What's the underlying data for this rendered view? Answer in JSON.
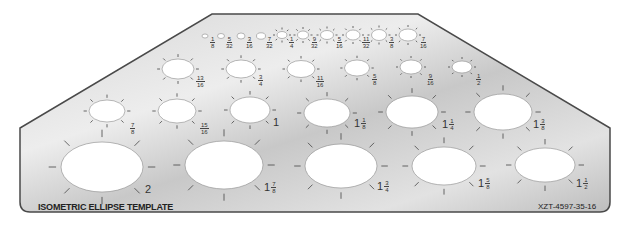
{
  "template": {
    "title": "ISOMETRIC ELLIPSE TEMPLATE",
    "part_number": "XZT-4597-35-16",
    "colors": {
      "plate": "#cfcfcf",
      "plate_highlight": "#ececec",
      "outline": "#555555",
      "hole": "#ffffff",
      "tick": "#444444"
    }
  },
  "ellipses": [
    {
      "size": "1/8",
      "whole": "",
      "num": "1",
      "den": "8",
      "cx": 205,
      "cy": 36,
      "rx": 3,
      "ry": 2,
      "lx": 210,
      "ly": 34,
      "ticks": false
    },
    {
      "size": "5/32",
      "whole": "",
      "num": "5",
      "den": "32",
      "cx": 221,
      "cy": 36,
      "rx": 3.5,
      "ry": 2.5,
      "lx": 226,
      "ly": 34,
      "ticks": false
    },
    {
      "size": "3/16",
      "whole": "",
      "num": "3",
      "den": "16",
      "cx": 241,
      "cy": 36,
      "rx": 4,
      "ry": 3,
      "lx": 246,
      "ly": 34,
      "ticks": false
    },
    {
      "size": "7/32",
      "whole": "",
      "num": "7",
      "den": "32",
      "cx": 261,
      "cy": 36,
      "rx": 4.5,
      "ry": 3.2,
      "lx": 266,
      "ly": 34,
      "ticks": false
    },
    {
      "size": "1/4",
      "whole": "",
      "num": "1",
      "den": "4",
      "cx": 282,
      "cy": 35,
      "rx": 5,
      "ry": 3.5,
      "lx": 289,
      "ly": 34,
      "ticks": true
    },
    {
      "size": "9/32",
      "whole": "",
      "num": "9",
      "den": "32",
      "cx": 303,
      "cy": 35,
      "rx": 5.5,
      "ry": 4,
      "lx": 311,
      "ly": 34,
      "ticks": true
    },
    {
      "size": "5/16",
      "whole": "",
      "num": "5",
      "den": "16",
      "cx": 327,
      "cy": 35,
      "rx": 6.5,
      "ry": 4.5,
      "lx": 336,
      "ly": 34,
      "ticks": true
    },
    {
      "size": "11/32",
      "whole": "",
      "num": "11",
      "den": "32",
      "cx": 353,
      "cy": 35,
      "rx": 7,
      "ry": 5,
      "lx": 362,
      "ly": 34,
      "ticks": true
    },
    {
      "size": "3/8",
      "whole": "",
      "num": "3",
      "den": "8",
      "cx": 379,
      "cy": 35,
      "rx": 7.5,
      "ry": 5.5,
      "lx": 389,
      "ly": 34,
      "ticks": true
    },
    {
      "size": "7/16",
      "whole": "",
      "num": "7",
      "den": "16",
      "cx": 408,
      "cy": 35,
      "rx": 9,
      "ry": 6,
      "lx": 420,
      "ly": 34,
      "ticks": true
    },
    {
      "size": "13/16",
      "whole": "",
      "num": "13",
      "den": "16",
      "cx": 178,
      "cy": 69,
      "rx": 16,
      "ry": 10,
      "lx": 196,
      "ly": 73,
      "ticks": true
    },
    {
      "size": "3/4",
      "whole": "",
      "num": "3",
      "den": "4",
      "cx": 241,
      "cy": 69,
      "rx": 15,
      "ry": 9,
      "lx": 258,
      "ly": 72,
      "ticks": true
    },
    {
      "size": "11/16",
      "whole": "",
      "num": "11",
      "den": "16",
      "cx": 301,
      "cy": 69,
      "rx": 14,
      "ry": 8.5,
      "lx": 316,
      "ly": 73,
      "ticks": true
    },
    {
      "size": "5/8",
      "whole": "",
      "num": "5",
      "den": "8",
      "cx": 357,
      "cy": 68,
      "rx": 12.5,
      "ry": 8,
      "lx": 372,
      "ly": 71,
      "ticks": true
    },
    {
      "size": "9/16",
      "whole": "",
      "num": "9",
      "den": "16",
      "cx": 411,
      "cy": 67,
      "rx": 11,
      "ry": 7,
      "lx": 427,
      "ly": 71,
      "ticks": true
    },
    {
      "size": "1/2",
      "whole": "",
      "num": "1",
      "den": "2",
      "cx": 462,
      "cy": 67,
      "rx": 10,
      "ry": 6,
      "lx": 476,
      "ly": 71,
      "ticks": true
    },
    {
      "size": "7/8",
      "whole": "",
      "num": "7",
      "den": "8",
      "cx": 107,
      "cy": 111,
      "rx": 18,
      "ry": 11,
      "lx": 130,
      "ly": 120,
      "ticks": true
    },
    {
      "size": "15/16",
      "whole": "",
      "num": "15",
      "den": "16",
      "cx": 177,
      "cy": 111,
      "rx": 19,
      "ry": 12,
      "lx": 200,
      "ly": 120,
      "ticks": true
    },
    {
      "size": "1",
      "whole": "1",
      "num": "",
      "den": "",
      "cx": 250,
      "cy": 110,
      "rx": 20,
      "ry": 13,
      "lx": 273,
      "ly": 119,
      "ticks": true
    },
    {
      "size": "1 1/8",
      "whole": "1",
      "num": "1",
      "den": "8",
      "cx": 327,
      "cy": 113,
      "rx": 23,
      "ry": 14,
      "lx": 354,
      "ly": 120,
      "ticks": true
    },
    {
      "size": "1 1/4",
      "whole": "1",
      "num": "1",
      "den": "4",
      "cx": 412,
      "cy": 112,
      "rx": 26,
      "ry": 16,
      "lx": 442,
      "ly": 121,
      "ticks": true
    },
    {
      "size": "1 3/8",
      "whole": "1",
      "num": "3",
      "den": "8",
      "cx": 503,
      "cy": 112,
      "rx": 29,
      "ry": 18,
      "lx": 533,
      "ly": 121,
      "ticks": true
    },
    {
      "size": "2",
      "whole": "2",
      "num": "",
      "den": "",
      "cx": 102,
      "cy": 167,
      "rx": 41,
      "ry": 25,
      "lx": 145,
      "ly": 186,
      "ticks": true
    },
    {
      "size": "1 7/8",
      "whole": "1",
      "num": "7",
      "den": "8",
      "cx": 224,
      "cy": 165,
      "rx": 39,
      "ry": 24,
      "lx": 264,
      "ly": 184,
      "ticks": true
    },
    {
      "size": "1 3/4",
      "whole": "1",
      "num": "3",
      "den": "4",
      "cx": 341,
      "cy": 166,
      "rx": 36,
      "ry": 22,
      "lx": 377,
      "ly": 183,
      "ticks": true
    },
    {
      "size": "1 5/8",
      "whole": "1",
      "num": "5",
      "den": "8",
      "cx": 444,
      "cy": 166,
      "rx": 32,
      "ry": 19,
      "lx": 478,
      "ly": 180,
      "ticks": true
    },
    {
      "size": "1 1/2",
      "whole": "1",
      "num": "1",
      "den": "2",
      "cx": 545,
      "cy": 165,
      "rx": 30,
      "ry": 17,
      "lx": 576,
      "ly": 180,
      "ticks": true
    }
  ]
}
